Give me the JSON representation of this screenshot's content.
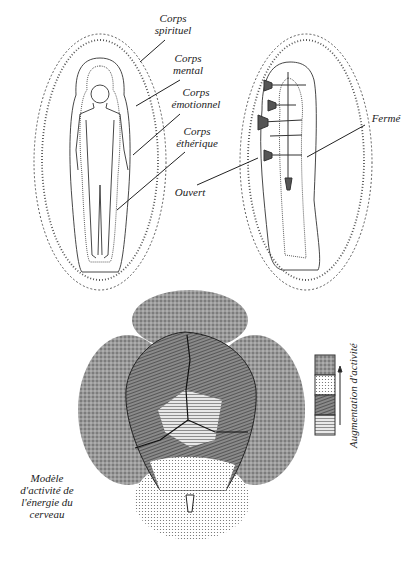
{
  "figure_top": {
    "labels": {
      "spirituel": {
        "line1": "Corps",
        "line2": "spirituel"
      },
      "mental": {
        "line1": "Corps",
        "line2": "mental"
      },
      "emotionnel": {
        "line1": "Corps",
        "line2": "émotionnel"
      },
      "etherique": {
        "line1": "Corps",
        "line2": "éthérique"
      },
      "ouvert": "Ouvert",
      "ferme": "Fermé"
    }
  },
  "figure_bottom": {
    "caption": {
      "line1": "Modèle",
      "line2": "d'activité de",
      "line3": "l'énergie du",
      "line4": "cerveau"
    },
    "legend": {
      "label": "Augmentation d'activité",
      "swatches": [
        "stippled-dark",
        "dotted-light",
        "hatched-dark",
        "lined-light"
      ]
    }
  }
}
